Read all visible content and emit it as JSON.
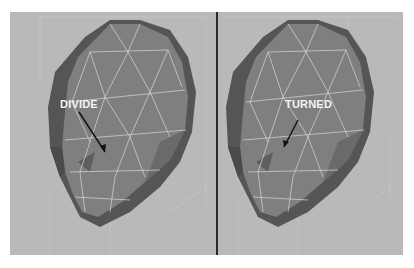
{
  "viewports": {
    "left": {
      "label": "DIVIDE",
      "operation": "divide-edge"
    },
    "right": {
      "label": "TURNED",
      "operation": "turn-edge"
    }
  },
  "colors": {
    "background": "#b9b9b9",
    "mesh_face": "#7f7f7f",
    "mesh_shadow": "#555555",
    "wireframe": "#d8d8d8",
    "label": "#f4f4f4",
    "divider": "#2a2a2a"
  }
}
